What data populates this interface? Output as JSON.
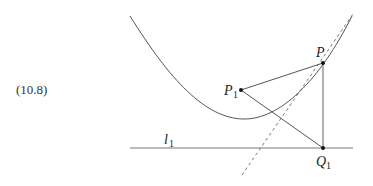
{
  "equation_number": "(10.8)",
  "points": {
    "P": {
      "label": "P",
      "sub": ""
    },
    "P1": {
      "label": "P",
      "sub": "1"
    },
    "Q1": {
      "label": "Q",
      "sub": "1"
    }
  },
  "line_label": {
    "label": "l",
    "sub": "1"
  },
  "elements": [
    "parabola",
    "directrix l1",
    "tangent at P (dashed)",
    "segment P-P1",
    "segment P-Q1",
    "segment P1-Q1"
  ]
}
